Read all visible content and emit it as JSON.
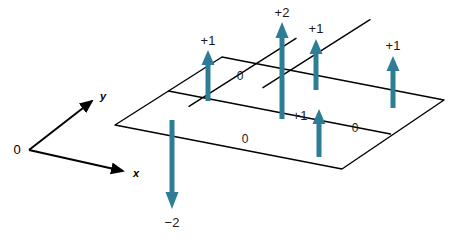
{
  "figure": {
    "title": "",
    "background_color": "#ffffff",
    "grid_line_color": "#000000",
    "arrow_color": "#2d7d96",
    "axis_color": "#000000",
    "text_color": "#1a1a1a"
  },
  "axes": {
    "origin_label": "0",
    "x_label": "x",
    "y_label": "y"
  },
  "grid": {
    "columns": 3,
    "rows": 2,
    "corners": {
      "left": [
        115,
        125
      ],
      "top": [
        222,
        57
      ],
      "right": [
        444,
        100
      ],
      "bottom": [
        342,
        169
      ]
    }
  },
  "cell_values": [
    {
      "label": "0",
      "x": 240,
      "y": 80
    },
    {
      "label": "0",
      "x": 245,
      "y": 143
    },
    {
      "label": "0",
      "x": 355,
      "y": 132
    }
  ],
  "arrows": [
    {
      "label": "+1",
      "direction": "up",
      "magnitude": 1,
      "shaft_x": 208,
      "tip_y": 52,
      "base_y": 101,
      "label_x": 208,
      "label_y": 45
    },
    {
      "label": "+2",
      "direction": "up",
      "magnitude": 2,
      "shaft_x": 282,
      "tip_y": 24,
      "base_y": 119,
      "label_x": 282,
      "label_y": 17
    },
    {
      "label": "+1",
      "direction": "up",
      "magnitude": 1,
      "shaft_x": 316,
      "tip_y": 40,
      "base_y": 90,
      "label_x": 316,
      "label_y": 33
    },
    {
      "label": "+1",
      "direction": "up",
      "magnitude": 1,
      "shaft_x": 319,
      "tip_y": 110,
      "base_y": 157,
      "label_x": 300,
      "label_y": 120
    },
    {
      "label": "+1",
      "direction": "up",
      "magnitude": 1,
      "shaft_x": 393,
      "tip_y": 57,
      "base_y": 108,
      "label_x": 393,
      "label_y": 50
    },
    {
      "label": "−2",
      "direction": "down",
      "magnitude": -2,
      "shaft_x": 172,
      "tip_y": 208,
      "base_y": 120,
      "label_x": 172,
      "label_y": 227
    }
  ]
}
